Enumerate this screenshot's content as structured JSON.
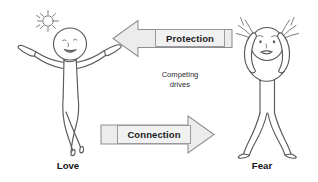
{
  "diagram": {
    "title_note": {
      "line1": "Competing",
      "line2": "drives"
    },
    "arrows": [
      {
        "id": "protection-arrow",
        "label": "Protection",
        "direction": "left",
        "fill": "#ececec",
        "stroke": "#8f8f93"
      },
      {
        "id": "connection-arrow",
        "label": "Connection",
        "direction": "right",
        "fill": "#ececec",
        "stroke": "#8f8f93"
      }
    ],
    "figures": [
      {
        "id": "love-figure",
        "caption": "Love",
        "mood": "joyful",
        "pose": "arms-raised-legs-crossed",
        "decoration": "sun-icon",
        "side": "left"
      },
      {
        "id": "fear-figure",
        "caption": "Fear",
        "mood": "anxious",
        "pose": "hands-on-head-legs-apart",
        "decoration": "stress-lines-icon",
        "side": "right"
      }
    ],
    "colors": {
      "background": "#ffffff",
      "line_art": "#5a5a5e",
      "arrow_fill": "#ececec",
      "arrow_stroke": "#8f8f93",
      "label_fill": "#f1f1f1",
      "label_border": "#9a9a9e",
      "text": "#15151a"
    }
  }
}
